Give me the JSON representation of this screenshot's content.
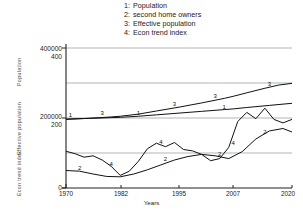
{
  "legend": {
    "entries": [
      {
        "key": "1:",
        "label": "Population"
      },
      {
        "key": "2:",
        "label": "second home owners"
      },
      {
        "key": "3:",
        "label": "Effective population"
      },
      {
        "key": "4:",
        "label": "Econ trend index"
      }
    ]
  },
  "axes": {
    "y_left_outer_ticks": [
      "400000",
      "200000",
      ""
    ],
    "y_left_inner_ticks": [
      "400",
      "200",
      "0"
    ],
    "y_side_labels": [
      "Population",
      "Effective population",
      "Econ trend index"
    ],
    "x_ticks": [
      "1970",
      "1982",
      "1995",
      "2007",
      "2020"
    ],
    "x_title": "Years"
  },
  "colors": {
    "curve": "#111111",
    "grid": "#9aa3ad",
    "axis": "#222222",
    "background": "#ffffff"
  },
  "chart_data": {
    "type": "line",
    "title": "",
    "xlabel": "Years",
    "ylabel": "",
    "xlim": [
      1970,
      2020
    ],
    "ylim_population": [
      0,
      400000
    ],
    "ylim_index": [
      0,
      400
    ],
    "grid": true,
    "legend_position": "top-center",
    "x_ticks": [
      1970,
      1982,
      1995,
      2007,
      2020
    ],
    "y_ticks_population": [
      0,
      200000,
      400000
    ],
    "y_ticks_index": [
      0,
      200,
      400
    ],
    "series": [
      {
        "name": "Population",
        "key": "1",
        "axis": "population",
        "x": [
          1970,
          1975,
          1980,
          1982,
          1986,
          1990,
          1995,
          2000,
          2005,
          2007,
          2010,
          2015,
          2020
        ],
        "values": [
          197000,
          199000,
          201000,
          202000,
          205000,
          209000,
          214000,
          219000,
          224000,
          226000,
          230000,
          236000,
          242000
        ]
      },
      {
        "name": "second home owners",
        "key": "2",
        "axis": "index",
        "x": [
          1970,
          1973,
          1976,
          1979,
          1982,
          1985,
          1988,
          1991,
          1994,
          1997,
          2000,
          2003,
          2006,
          2009,
          2012,
          2015,
          2018,
          2020
        ],
        "values": [
          50,
          48,
          40,
          33,
          32,
          40,
          52,
          66,
          80,
          90,
          96,
          92,
          84,
          104,
          140,
          163,
          170,
          160
        ]
      },
      {
        "name": "Effective population",
        "key": "3",
        "axis": "population",
        "x": [
          1970,
          1975,
          1980,
          1982,
          1986,
          1990,
          1995,
          2000,
          2005,
          2007,
          2010,
          2014,
          2017,
          2020
        ],
        "values": [
          196000,
          199000,
          203000,
          205000,
          211000,
          220000,
          231000,
          243000,
          256000,
          262000,
          272000,
          285000,
          294000,
          299000
        ]
      },
      {
        "name": "Econ trend index",
        "key": "4",
        "axis": "index",
        "x": [
          1970,
          1972,
          1974,
          1976,
          1978,
          1980,
          1982,
          1984,
          1986,
          1988,
          1990,
          1992,
          1994,
          1996,
          1998,
          2000,
          2002,
          2004,
          2006,
          2008,
          2010,
          2012,
          2014,
          2016,
          2018,
          2020
        ],
        "values": [
          105,
          98,
          88,
          92,
          80,
          62,
          36,
          48,
          76,
          112,
          128,
          118,
          130,
          110,
          106,
          96,
          78,
          84,
          116,
          190,
          216,
          198,
          228,
          196,
          186,
          196
        ]
      }
    ],
    "curve_labels": [
      {
        "key": "1",
        "x": 1971,
        "axis_value": 200000,
        "series": "Population"
      },
      {
        "key": "1",
        "x": 1986,
        "axis_value": 205000,
        "series": "Population"
      },
      {
        "key": "1",
        "x": 2005,
        "axis_value": 222000,
        "series": "Population"
      },
      {
        "key": "2",
        "x": 1973,
        "axis_value": 48,
        "series": "second home owners"
      },
      {
        "key": "2",
        "x": 1992,
        "axis_value": 72,
        "series": "second home owners"
      },
      {
        "key": "2",
        "x": 2004,
        "axis_value": 86,
        "series": "second home owners"
      },
      {
        "key": "2",
        "x": 2014,
        "axis_value": 150,
        "series": "second home owners"
      },
      {
        "key": "3",
        "x": 1978,
        "axis_value": 203000,
        "series": "Effective population"
      },
      {
        "key": "3",
        "x": 1994,
        "axis_value": 230000,
        "series": "Effective population"
      },
      {
        "key": "3",
        "x": 2003,
        "axis_value": 252000,
        "series": "Effective population"
      },
      {
        "key": "3",
        "x": 2015,
        "axis_value": 288000,
        "series": "Effective population"
      },
      {
        "key": "4",
        "x": 1980,
        "axis_value": 60,
        "series": "Econ trend index"
      },
      {
        "key": "4",
        "x": 1991,
        "axis_value": 122,
        "series": "Econ trend index"
      },
      {
        "key": "4",
        "x": 2007,
        "axis_value": 120,
        "series": "Econ trend index"
      }
    ]
  }
}
